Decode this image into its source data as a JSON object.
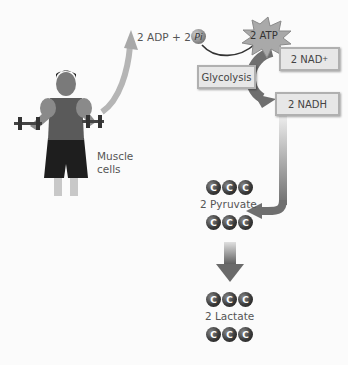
{
  "reactants": {
    "adp": "2 ADP",
    "plus": "+",
    "pi_count": "2",
    "pi_symbol": "Pi"
  },
  "atp": {
    "label": "2 ATP"
  },
  "nad_plus": {
    "label": "2 NAD",
    "sup": "+"
  },
  "glycolysis": {
    "label": "Glycolysis"
  },
  "nadh": {
    "label": "2 NADH"
  },
  "muscle": {
    "line1": "Muscle",
    "line2": "cells"
  },
  "pyruvate": {
    "label": "2 Pyruvate",
    "atoms": [
      "C",
      "C",
      "C",
      "C",
      "C",
      "C"
    ]
  },
  "lactate": {
    "label": "2 Lactate",
    "atoms": [
      "C",
      "C",
      "C",
      "C",
      "C",
      "C"
    ]
  },
  "colors": {
    "box_fill": "#e7e7e7",
    "box_border": "#b0b0b0",
    "carbon": "#2a2a2a",
    "arrow": "#8a8a8a"
  }
}
